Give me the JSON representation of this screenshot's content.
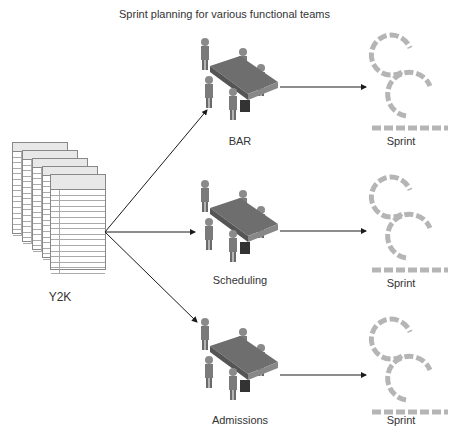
{
  "title": "Sprint planning for various functional teams",
  "source": {
    "label": "Y2K",
    "sheet_header": "Backlog Description",
    "sheet_subheader": "Title (Users)",
    "rows": [
      "Project selection of new",
      "Template training for",
      "Create product backlog",
      "Create sprint backlog",
      "Display (list) view of",
      "Testing",
      "Create a new product",
      "Create a new product",
      "Annotation product",
      "Annotation window",
      "Display (list) view",
      "Display annotation",
      "Testing",
      "Automatic record linking",
      "All changes are made"
    ]
  },
  "teams": [
    {
      "name": "BAR",
      "output": "Sprint"
    },
    {
      "name": "Scheduling",
      "output": "Sprint"
    },
    {
      "name": "Admissions",
      "output": "Sprint"
    }
  ],
  "colors": {
    "figure": "#8a8a8a",
    "table": "#6e6e6e",
    "sprint": "#b5b5b5",
    "arrow": "#1a1a1a"
  }
}
